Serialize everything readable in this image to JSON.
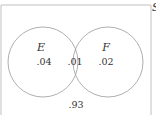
{
  "diagram": {
    "type": "venn",
    "universe_label": "S",
    "sets": [
      {
        "name": "E",
        "only_value": ".04"
      },
      {
        "name": "F",
        "only_value": ".02"
      }
    ],
    "intersection_value": ".01",
    "outside_value": ".93"
  },
  "colors": {
    "stroke": "#9a9a9a",
    "text": "#333333",
    "background": "#ffffff"
  }
}
